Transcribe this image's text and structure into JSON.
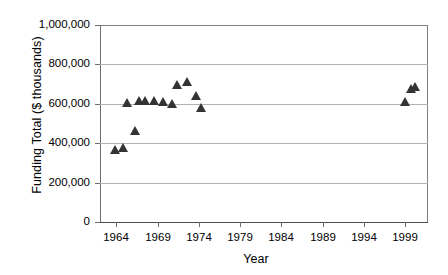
{
  "chart_data": {
    "type": "scatter",
    "title": "",
    "xlabel": "Year",
    "ylabel": "Funding Total ($ thousands)",
    "xlim": [
      1962,
      2001.8
    ],
    "ylim": [
      0,
      1000000
    ],
    "grid": true,
    "legend": "none",
    "marker": "triangle",
    "marker_color": "#333333",
    "xticks": [
      1964,
      1969,
      1974,
      1979,
      1984,
      1989,
      1994,
      1999
    ],
    "xtick_labels": [
      "1964",
      "1969",
      "1974",
      "1979",
      "1984",
      "1989",
      "1994",
      "1999"
    ],
    "yticks": [
      0,
      200000,
      400000,
      600000,
      800000,
      1000000
    ],
    "ytick_labels": [
      "0",
      "200,000",
      "400,000",
      "600,000",
      "800,000",
      "1,000,000"
    ],
    "series": [
      {
        "name": "Funding Total",
        "points": [
          {
            "x": 1963.8,
            "y": 366000
          },
          {
            "x": 1964.8,
            "y": 376000
          },
          {
            "x": 1965.3,
            "y": 609000
          },
          {
            "x": 1966.2,
            "y": 462000
          },
          {
            "x": 1966.7,
            "y": 619000
          },
          {
            "x": 1967.5,
            "y": 619000
          },
          {
            "x": 1968.5,
            "y": 619000
          },
          {
            "x": 1969.6,
            "y": 614000
          },
          {
            "x": 1970.7,
            "y": 599000
          },
          {
            "x": 1971.4,
            "y": 696000
          },
          {
            "x": 1972.6,
            "y": 711000
          },
          {
            "x": 1973.6,
            "y": 640000
          },
          {
            "x": 1974.3,
            "y": 579000
          },
          {
            "x": 1999.0,
            "y": 614000
          },
          {
            "x": 1999.7,
            "y": 680000
          },
          {
            "x": 2000.2,
            "y": 690000
          }
        ]
      }
    ]
  }
}
